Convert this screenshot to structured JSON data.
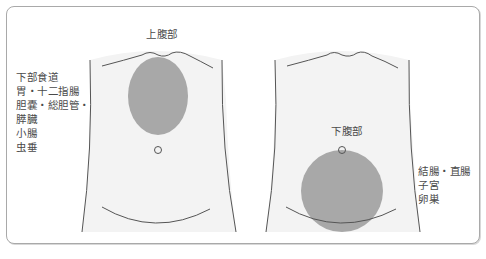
{
  "figure": {
    "left_panel": {
      "region_label": "上腹部",
      "organs": [
        "下部食道",
        "胃・十二指腸",
        "胆嚢・総胆管・",
        "膵臓",
        "小腸",
        "虫垂"
      ],
      "highlight_shape": "ellipse"
    },
    "right_panel": {
      "region_label": "下腹部",
      "organs": [
        "結腸・直腸",
        "子宮",
        "卵巣"
      ],
      "highlight_shape": "circle"
    },
    "colors": {
      "highlight": "#a8a8a8",
      "torso_fill": "#f3f3f3",
      "outline": "#555555",
      "frame_border": "#a9a9a9",
      "text": "#4a4a4a"
    }
  }
}
